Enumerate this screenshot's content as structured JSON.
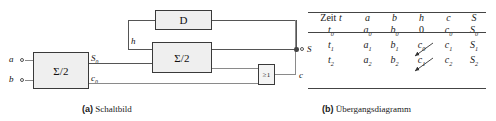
{
  "figure": {
    "panels": [
      {
        "key": "a",
        "tag": "(a)",
        "caption": "Schaltbild"
      },
      {
        "key": "b",
        "tag": "(b)",
        "caption": "Übergangsdiagramm"
      }
    ]
  },
  "circuit": {
    "blocks": [
      {
        "name": "half-adder-1",
        "label": "Σ/2"
      },
      {
        "name": "d-flipflop",
        "label": "D"
      },
      {
        "name": "half-adder-2",
        "label": "Σ/2"
      },
      {
        "name": "or-gate",
        "label": "≥1"
      }
    ],
    "signals": {
      "input_a": "a",
      "input_b": "b",
      "sum0": "S",
      "sum0_sub": "0",
      "carry0": "c",
      "carry0_sub": "0",
      "feedback_h": "h",
      "output_S": "S",
      "output_c": "c"
    }
  },
  "table": {
    "headers": [
      "Zeit t",
      "a",
      "b",
      "h",
      "c",
      "S"
    ],
    "header_time_word": "Zeit",
    "header_time_var": "t",
    "rows": [
      {
        "time": "t",
        "time_sub": "0",
        "a": "a",
        "a_sub": "0",
        "b": "b",
        "b_sub": "0",
        "h": "0",
        "h_sub": "",
        "c": "c",
        "c_sub": "0",
        "S": "S",
        "S_sub": "0"
      },
      {
        "time": "t",
        "time_sub": "1",
        "a": "a",
        "a_sub": "1",
        "b": "b",
        "b_sub": "1",
        "h": "c",
        "h_sub": "0",
        "c": "c",
        "c_sub": "1",
        "S": "S",
        "S_sub": "1"
      },
      {
        "time": "t",
        "time_sub": "2",
        "a": "a",
        "a_sub": "2",
        "b": "b",
        "b_sub": "2",
        "h": "c",
        "h_sub": "1",
        "c": "c",
        "c_sub": "2",
        "S": "S",
        "S_sub": "2"
      }
    ],
    "transitions": [
      {
        "from": "c0",
        "to": "h1"
      },
      {
        "from": "c1",
        "to": "h2"
      }
    ]
  },
  "colors": {
    "wire": "#8a8a8a",
    "block_fill": "#efefef",
    "block_stroke": "#3a3a3a",
    "rule": "#444444",
    "text": "#111111",
    "background": "#ffffff"
  }
}
